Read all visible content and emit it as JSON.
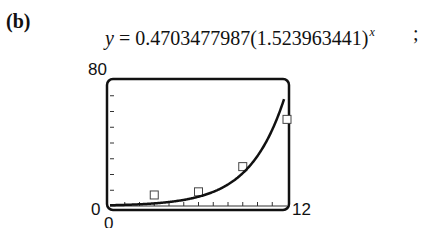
{
  "part_label": "(b)",
  "top_cut_text": "........ ........",
  "equation": {
    "lhs": "y",
    "equals": "=",
    "coefficient": "0.4703477987",
    "base": "(1.523963441)",
    "exponent": "x",
    "trailing": ";"
  },
  "chart_data": {
    "type": "scatter",
    "title": "",
    "xlabel": "",
    "ylabel": "",
    "xlim": [
      0,
      12
    ],
    "ylim": [
      0,
      80
    ],
    "x_tick_labels": {
      "xmin": "0",
      "xmax": "12"
    },
    "y_tick_labels": {
      "ymin": "0",
      "ymax": "80"
    },
    "x_ticks_count": 12,
    "y_ticks_count": 8,
    "grid": false,
    "series": [
      {
        "name": "data",
        "marker": "square",
        "x": [
          3,
          6,
          9,
          12
        ],
        "y": [
          7,
          9,
          25,
          55
        ]
      },
      {
        "name": "fit",
        "kind": "line",
        "model": "y = 0.4703477987(1.523963441)^x",
        "a": 0.4703477987,
        "b": 1.523963441
      }
    ]
  }
}
